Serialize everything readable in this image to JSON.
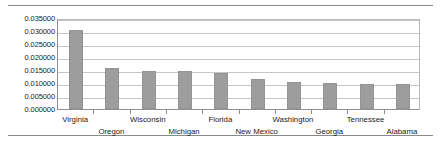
{
  "chart_data": {
    "type": "bar",
    "title": "",
    "subtitle": "",
    "xlabel": "",
    "ylabel": "",
    "grid": true,
    "legend": "none",
    "categories": [
      "Virginia",
      "Oregon",
      "Wisconsin",
      "Michigan",
      "Florida",
      "New Mexico",
      "Washington",
      "Georgia",
      "Tennessee",
      "Alabama"
    ],
    "values": [
      0.0303,
      0.0158,
      0.0148,
      0.01475,
      0.014,
      0.01165,
      0.01035,
      0.0101,
      0.00965,
      0.0095
    ],
    "ylim": [
      0.0,
      0.035
    ],
    "ytick_step": 0.005,
    "ytick_labels": [
      "0.035000",
      "0.030000",
      "0.025000",
      "0.020000",
      "0.015000",
      "0.010000",
      "0.005000",
      "0.000000"
    ],
    "ytick_values": [
      0.035,
      0.03,
      0.025,
      0.02,
      0.015,
      0.01,
      0.005,
      0.0
    ],
    "bar_color": "#9d9d9d",
    "bar_border_color": "#949494",
    "gridline_color": "#c6c6c6",
    "axis_color": "#8f8f8f",
    "rule_color": "#8a8a8a",
    "label_rows": [
      0,
      1,
      0,
      1,
      0,
      1,
      0,
      1,
      0,
      1
    ]
  }
}
